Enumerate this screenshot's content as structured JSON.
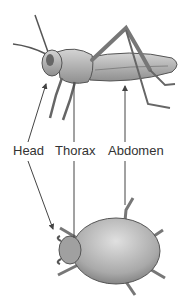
{
  "figure": {
    "labels": [
      {
        "id": "head",
        "text": "Head"
      },
      {
        "id": "thorax",
        "text": "Thorax"
      },
      {
        "id": "abdomen",
        "text": "Abdomen"
      }
    ],
    "organisms": [
      {
        "name": "grasshopper",
        "position": "top"
      },
      {
        "name": "tick",
        "position": "bottom"
      }
    ],
    "colors": {
      "line": "#444444",
      "body_fill": "#bdbdbd",
      "body_shade": "#8a8a8a",
      "text": "#333333"
    }
  }
}
